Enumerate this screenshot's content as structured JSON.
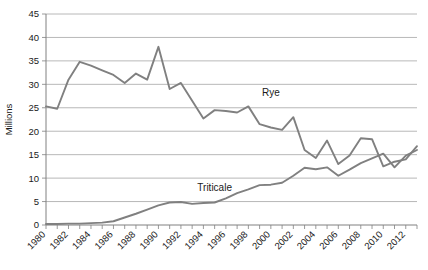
{
  "chart_data": {
    "type": "line",
    "title": "",
    "xlabel": "",
    "ylabel": "Millions",
    "ylim": [
      0,
      45
    ],
    "ytick_values": [
      0,
      5,
      10,
      15,
      20,
      25,
      30,
      35,
      40,
      45
    ],
    "ytick_labels": [
      "0",
      "5",
      "10",
      "15",
      "20",
      "25",
      "30",
      "35",
      "40",
      "45"
    ],
    "xlim": [
      1980,
      2013
    ],
    "xtick_labels": [
      "1980",
      "1982",
      "1984",
      "1986",
      "1988",
      "1990",
      "1992",
      "1994",
      "1996",
      "1998",
      "2000",
      "2002",
      "2004",
      "2006",
      "2008",
      "2010",
      "2012"
    ],
    "x": [
      1980,
      1981,
      1982,
      1983,
      1984,
      1985,
      1986,
      1987,
      1988,
      1989,
      1990,
      1991,
      1992,
      1993,
      1994,
      1995,
      1996,
      1997,
      1998,
      1999,
      2000,
      2001,
      2002,
      2003,
      2004,
      2005,
      2006,
      2007,
      2008,
      2009,
      2010,
      2011,
      2012,
      2013
    ],
    "grid": true,
    "legend_position": "inline-annotation",
    "series": [
      {
        "name": "Rye",
        "color": "#808080",
        "label_year": 2000,
        "label_value": 27.5,
        "values": [
          25.3,
          24.8,
          31.0,
          34.8,
          34.0,
          33.0,
          32.0,
          30.3,
          32.3,
          31.0,
          38.0,
          29.0,
          30.3,
          26.5,
          22.7,
          24.5,
          24.3,
          24.0,
          25.3,
          21.5,
          20.8,
          20.3,
          23.0,
          16.0,
          14.3,
          18.0,
          13.0,
          14.8,
          18.5,
          18.3,
          12.5,
          13.5,
          14.0,
          16.8
        ]
      },
      {
        "name": "Triticale",
        "color": "#808080",
        "label_year": 1995,
        "label_value": 7.2,
        "values": [
          0.2,
          0.2,
          0.3,
          0.3,
          0.4,
          0.5,
          0.8,
          1.6,
          2.4,
          3.3,
          4.2,
          4.8,
          4.9,
          4.5,
          4.7,
          4.8,
          5.7,
          6.8,
          7.6,
          8.5,
          8.6,
          9.0,
          10.5,
          12.2,
          11.9,
          12.3,
          10.5,
          11.8,
          13.2,
          14.2,
          15.2,
          12.3,
          14.8,
          16.0
        ]
      }
    ]
  }
}
